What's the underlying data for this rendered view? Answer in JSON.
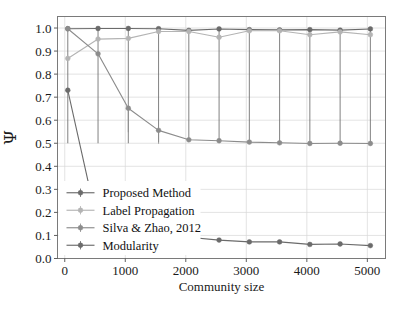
{
  "chart_data": {
    "type": "line",
    "title": "",
    "xlabel": "Community size",
    "ylabel": "Ψ",
    "xlim": [
      -120,
      5300
    ],
    "ylim": [
      0.0,
      1.05
    ],
    "grid": true,
    "legend_position": "lower-left",
    "x_ticks": [
      0,
      1000,
      2000,
      3000,
      4000,
      5000
    ],
    "x_tick_labels": [
      "0",
      "1000",
      "2000",
      "3000",
      "4000",
      "5000"
    ],
    "y_ticks": [
      0.0,
      0.1,
      0.2,
      0.3,
      0.4,
      0.5,
      0.6,
      0.7,
      0.8,
      0.9,
      1.0
    ],
    "y_tick_labels": [
      "0.0",
      "0.1",
      "0.2",
      "0.3",
      "0.4",
      "0.5",
      "0.6",
      "0.7",
      "0.8",
      "0.9",
      "1.0"
    ],
    "x": [
      50,
      550,
      1050,
      1550,
      2050,
      2550,
      3050,
      3550,
      4050,
      4550,
      5050
    ],
    "series": [
      {
        "name": "Proposed Method",
        "color": "#6b6b6b",
        "marker": "o",
        "values": [
          0.997,
          0.998,
          0.998,
          0.997,
          0.99,
          0.996,
          0.993,
          0.992,
          0.993,
          0.991,
          0.996
        ],
        "err_low": [
          0.5,
          0.5,
          0.5,
          0.505,
          0.515,
          0.51,
          0.505,
          0.502,
          0.5,
          0.5,
          0.5
        ],
        "err_high": [
          0.997,
          0.998,
          0.998,
          0.997,
          0.99,
          0.996,
          0.993,
          0.992,
          0.993,
          0.991,
          0.996
        ]
      },
      {
        "name": "Label Propagation",
        "color": "#b4b4b4",
        "marker": "o",
        "values": [
          0.868,
          0.952,
          0.955,
          0.985,
          0.985,
          0.96,
          0.988,
          0.988,
          0.971,
          0.983,
          0.971
        ],
        "err_low": [
          0.868,
          0.952,
          0.955,
          0.985,
          0.985,
          0.96,
          0.988,
          0.988,
          0.971,
          0.983,
          0.971
        ],
        "err_high": [
          0.868,
          0.952,
          0.955,
          0.985,
          0.985,
          0.96,
          0.988,
          0.988,
          0.971,
          0.983,
          0.971
        ]
      },
      {
        "name": "Silva & Zhao, 2012",
        "color": "#8c8c8c",
        "marker": "o",
        "values": [
          0.997,
          0.888,
          0.652,
          0.556,
          0.515,
          0.511,
          0.505,
          0.502,
          0.499,
          0.5,
          0.499
        ],
        "err_low": [
          0.997,
          0.888,
          0.548,
          0.498,
          0.515,
          0.511,
          0.505,
          0.502,
          0.499,
          0.5,
          0.499
        ],
        "err_high": [
          0.997,
          0.888,
          0.652,
          0.556,
          0.515,
          0.511,
          0.505,
          0.502,
          0.499,
          0.5,
          0.499
        ]
      },
      {
        "name": "Modularity",
        "color": "#6b6b6b",
        "marker": "o",
        "values": [
          0.73,
          0.14,
          0.108,
          0.098,
          0.092,
          0.08,
          0.072,
          0.072,
          0.061,
          0.063,
          0.056
        ],
        "err_low": [
          0.73,
          0.14,
          0.108,
          0.098,
          0.092,
          0.08,
          0.072,
          0.072,
          0.061,
          0.063,
          0.056
        ],
        "err_high": [
          0.73,
          0.14,
          0.108,
          0.098,
          0.092,
          0.08,
          0.072,
          0.072,
          0.061,
          0.063,
          0.056
        ]
      }
    ]
  },
  "legend": {
    "entries": [
      {
        "label": "Proposed Method",
        "color": "#6b6b6b"
      },
      {
        "label": "Label Propagation",
        "color": "#b4b4b4"
      },
      {
        "label": "Silva & Zhao, 2012",
        "color": "#8c8c8c"
      },
      {
        "label": "Modularity",
        "color": "#6b6b6b"
      }
    ]
  },
  "axes": {
    "x_title": "Community size",
    "y_title": "Ψ"
  },
  "colors": {
    "frame": "#7a7a7a",
    "grid": "#d7d7d7",
    "text": "#1a1a1a",
    "background": "#ffffff"
  }
}
